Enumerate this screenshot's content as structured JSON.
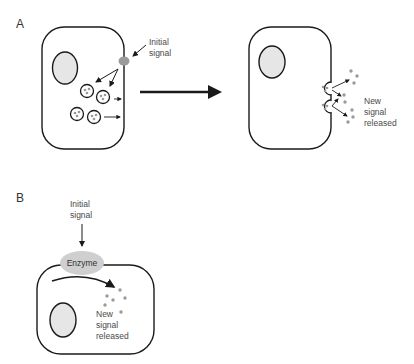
{
  "figure": {
    "panels": [
      {
        "id": "A",
        "label": "A",
        "left_cell": {
          "annotation": [
            "Initial",
            "signal"
          ],
          "vesicle_count": 4
        },
        "transition_arrow": "right-arrow",
        "right_cell": {
          "annotation": [
            "New",
            "signal",
            "released"
          ],
          "exocytosis_vesicles": 2
        }
      },
      {
        "id": "B",
        "label": "B",
        "input_label": [
          "Initial",
          "signal"
        ],
        "enzyme_label": "Enzyme",
        "output_label": [
          "New",
          "signal",
          "released"
        ]
      }
    ],
    "colors": {
      "outline": "#1a1a1a",
      "nucleus_fill": "#e6e6e6",
      "signal_fill": "#9a9a9a",
      "enzyme_fill": "#cfcfcf",
      "text": "#4a4a4a"
    }
  },
  "panelA": {
    "label": "A",
    "initial_signal_1": "Initial",
    "initial_signal_2": "signal",
    "new_1": "New",
    "new_2": "signal",
    "new_3": "released"
  },
  "panelB": {
    "label": "B",
    "initial_signal_1": "Initial",
    "initial_signal_2": "signal",
    "enzyme": "Enzyme",
    "new_1": "New",
    "new_2": "signal",
    "new_3": "released"
  }
}
